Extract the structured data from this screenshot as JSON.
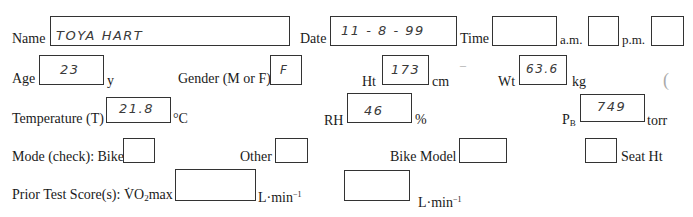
{
  "row1": {
    "name": {
      "label": "Name",
      "value": "TOYA  HART"
    },
    "date": {
      "label": "Date",
      "value": "11 - 8 - 99"
    },
    "time": {
      "label": "Time",
      "value": ""
    },
    "am": {
      "label": "a.m.",
      "value": ""
    },
    "pm": {
      "label": "p.m.",
      "value": ""
    }
  },
  "row2": {
    "age": {
      "label": "Age",
      "value": "23",
      "unit": "y"
    },
    "gender": {
      "label": "Gender (M or F)",
      "value": "F"
    },
    "height": {
      "label": "Ht",
      "value": "173",
      "unit": "cm"
    },
    "weight": {
      "label": "Wt",
      "value": "63.6",
      "unit": "kg"
    }
  },
  "row3": {
    "temperature": {
      "label": "Temperature (T)",
      "value": "21.8",
      "unit": "°C"
    },
    "rh": {
      "label": "RH",
      "value": "46",
      "unit": "%"
    },
    "pb": {
      "label_main": "P",
      "label_sub": "B",
      "value": "749",
      "unit": "torr"
    }
  },
  "row4": {
    "mode_label": "Mode (check): Bike",
    "bike": {
      "value": ""
    },
    "other": {
      "label": "Other",
      "value": ""
    },
    "bike_model": {
      "label": "Bike Model",
      "value": ""
    },
    "seat_ht": {
      "label": "Seat Ht",
      "value": ""
    }
  },
  "row5": {
    "prior_label_pre": "Prior Test Score(s): ",
    "vo2_v": "V",
    "vo2_o": "O",
    "vo2_sub": "2",
    "vo2_max": "max",
    "score1": {
      "value": "",
      "unit_main": "L·min",
      "unit_sup": "−1"
    },
    "score2": {
      "value": "",
      "unit_main": "L·min",
      "unit_sup": "−1"
    }
  }
}
